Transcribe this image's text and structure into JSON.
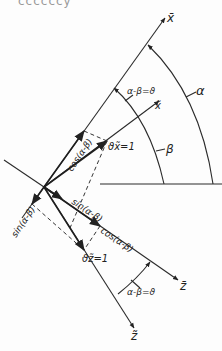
{
  "header_fragment": "ccccccy",
  "labels": {
    "x_bar": "x̄",
    "x_tilde": "x̃",
    "z_bar": "z̄",
    "z_tilde": "z̃",
    "alpha": "α",
    "beta": "β",
    "alpha_minus_beta_top": "α-β=ϑ",
    "alpha_minus_beta_bottom": "α-β=ϑ",
    "cos_upper": "cos(α-β)",
    "sin_left": "sin(α-β)",
    "sin_lower": "sin(α-β)",
    "cos_lower": "cos(α-β)",
    "v_x": "ϑx̃=1",
    "v_z": "ϑz̃=1"
  }
}
